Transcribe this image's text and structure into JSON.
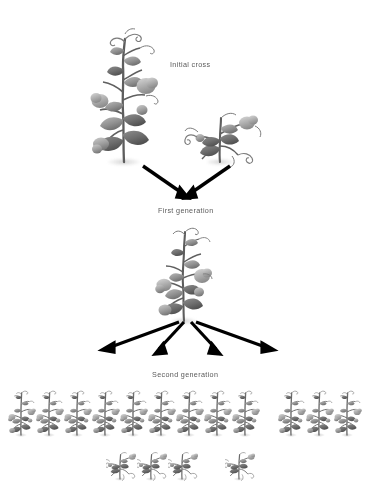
{
  "figure": {
    "type": "diagram",
    "background_color": "#ffffff",
    "ink_color": "#000000",
    "label_color": "#3a3a3a",
    "width": 374,
    "height": 496
  },
  "labels": {
    "initial_cross": "Initial cross",
    "first_generation": "First generation",
    "second_generation": "Second generation"
  },
  "chart_data": {
    "type": "diagram",
    "title": "",
    "generations": [
      {
        "name": "Initial cross",
        "label": "Initial cross",
        "plants": [
          {
            "phenotype": "tall",
            "count": 1,
            "position": "left"
          },
          {
            "phenotype": "dwarf",
            "count": 1,
            "position": "right"
          }
        ],
        "arrows_out": 2,
        "arrow_direction": "converging"
      },
      {
        "name": "First generation",
        "label": "First generation",
        "plants": [
          {
            "phenotype": "tall",
            "count": 1,
            "position": "center"
          }
        ],
        "arrows_out": 4,
        "arrow_direction": "diverging"
      },
      {
        "name": "Second generation",
        "label": "Second generation",
        "plants": [
          {
            "phenotype": "tall",
            "count": 9,
            "position": "row-1-left-group"
          },
          {
            "phenotype": "tall",
            "count": 3,
            "position": "row-1-right-group"
          },
          {
            "phenotype": "dwarf",
            "count": 3,
            "position": "row-2-left-group"
          },
          {
            "phenotype": "dwarf",
            "count": 1,
            "position": "row-2-right-single"
          }
        ],
        "totals": {
          "tall": 12,
          "dwarf": 4,
          "ratio": "3:1"
        }
      }
    ]
  },
  "plant_rows": {
    "second_generation_tall_row": {
      "count": 12,
      "group_a_count": 9,
      "group_b_count": 3,
      "y": 386,
      "start_x": 8,
      "spacing": 28,
      "group_gap": 18
    },
    "second_generation_dwarf_row": {
      "count": 4,
      "group_a_count": 3,
      "group_b_count": 1,
      "y": 448,
      "start_x": 106,
      "spacing": 31,
      "group_gap": 26
    }
  },
  "arrows": {
    "initial_to_first": [
      {
        "x1": 143,
        "y1": 166,
        "x2": 185,
        "y2": 196
      },
      {
        "x1": 227,
        "y1": 166,
        "x2": 189,
        "y2": 196
      }
    ],
    "first_to_second": [
      {
        "x1": 178,
        "y1": 325,
        "x2": 103,
        "y2": 350
      },
      {
        "x1": 184,
        "y1": 325,
        "x2": 158,
        "y2": 352
      },
      {
        "x1": 190,
        "y1": 325,
        "x2": 216,
        "y2": 352
      },
      {
        "x1": 196,
        "y1": 325,
        "x2": 272,
        "y2": 350
      }
    ]
  }
}
